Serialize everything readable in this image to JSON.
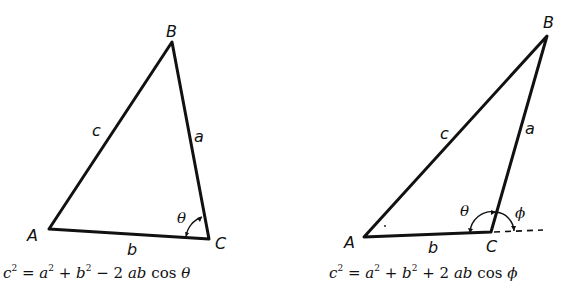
{
  "figure": {
    "left": {
      "vertices": {
        "A": "A",
        "B": "B",
        "C": "C"
      },
      "sides": {
        "a": "a",
        "b": "b",
        "c": "c"
      },
      "angle": "θ",
      "formula": {
        "lhs": "c",
        "eq": "=",
        "t1": "a",
        "plus": "+",
        "t2": "b",
        "op": "−",
        "coef": "2",
        "prod": "ab",
        "fn": "cos",
        "arg": "θ",
        "exp": "2"
      }
    },
    "right": {
      "vertices": {
        "A": "A",
        "B": "B",
        "C": "C"
      },
      "sides": {
        "a": "a",
        "b": "b",
        "c": "c"
      },
      "angle_interior": "θ",
      "angle_exterior": "ϕ",
      "formula": {
        "lhs": "c",
        "eq": "=",
        "t1": "a",
        "plus": "+",
        "t2": "b",
        "op": "+",
        "coef": "2",
        "prod": "ab",
        "fn": "cos",
        "arg": "ϕ",
        "exp": "2"
      }
    }
  }
}
